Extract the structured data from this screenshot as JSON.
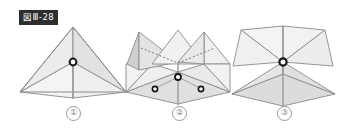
{
  "figure": {
    "label": "図Ⅲ-28",
    "label_bg_color": "#2e2e2e",
    "label_text_color": "#ffffff",
    "background_color": "#ffffff",
    "stroke_color": "#8a8a8a",
    "fill_light": "#f2f2f2",
    "fill_mid": "#e4e4e4",
    "fill_dark": "#d8d8d8",
    "node_outline_color": "#1a1a1a",
    "node_fill_color": "#ffffff"
  },
  "panels": [
    {
      "number": "①",
      "name": "pyramid-folded",
      "node_count": 1
    },
    {
      "number": "②",
      "name": "pyramid-partially-unfolded",
      "node_count": 3
    },
    {
      "number": "③",
      "name": "pyramid-unfolded",
      "node_count": 1
    }
  ]
}
